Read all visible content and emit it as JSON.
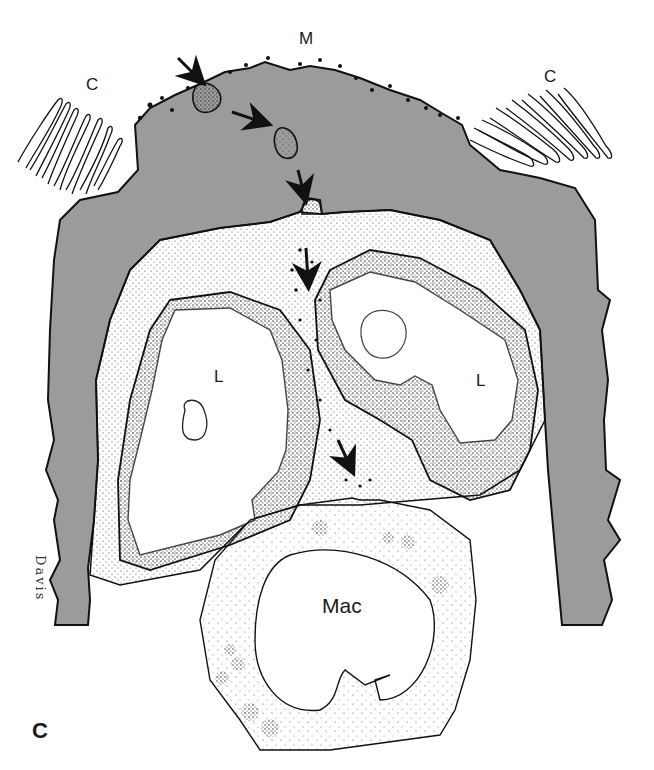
{
  "figure": {
    "panel_label": "C",
    "labels": {
      "microvillus_surface": "M",
      "cilia_left": "C",
      "cilia_right": "C",
      "lumen_left": "L",
      "lumen_right": "L",
      "macrophage": "Mac"
    },
    "signature": "Davis",
    "colors": {
      "epithelium_gray": "#9b9b9b",
      "outline": "#111111",
      "stipple": "#222222",
      "background": "#ffffff"
    },
    "arrows": [
      {
        "from": [
          176,
          56
        ],
        "to": [
          200,
          80
        ]
      },
      {
        "from": [
          230,
          112
        ],
        "to": [
          264,
          122
        ]
      },
      {
        "from": [
          298,
          168
        ],
        "to": [
          306,
          196
        ]
      },
      {
        "from": [
          306,
          246
        ],
        "to": [
          308,
          282
        ]
      },
      {
        "from": [
          336,
          438
        ],
        "to": [
          350,
          468
        ]
      }
    ]
  }
}
